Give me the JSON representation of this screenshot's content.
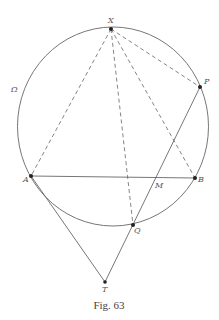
{
  "figure": {
    "caption": "Fig. 63",
    "circle_label": "Ω",
    "colors": {
      "stroke": "#666666",
      "point": "#222222",
      "text": "#555555"
    },
    "circle": {
      "cx": 113,
      "cy": 126.5,
      "rx": 95.5,
      "ry": 99.5
    },
    "points": {
      "X": {
        "label": "X",
        "x": 111,
        "y": 29
      },
      "P": {
        "label": "P",
        "x": 200,
        "y": 87
      },
      "A": {
        "label": "A",
        "x": 31,
        "y": 176
      },
      "B": {
        "label": "B",
        "x": 195,
        "y": 178
      },
      "M": {
        "label": "M",
        "x": 157,
        "y": 177
      },
      "Q": {
        "label": "Q",
        "x": 133,
        "y": 225
      },
      "T": {
        "label": "T",
        "x": 105,
        "y": 282
      }
    },
    "segments": [
      {
        "from": "X",
        "to": "A",
        "style": "dashed"
      },
      {
        "from": "X",
        "to": "Q",
        "style": "dashed"
      },
      {
        "from": "X",
        "to": "B",
        "style": "dashed"
      },
      {
        "from": "X",
        "to": "P",
        "style": "dashed"
      },
      {
        "from": "A",
        "to": "B",
        "style": "solid"
      },
      {
        "from": "A",
        "to": "T",
        "style": "solid"
      },
      {
        "from": "T",
        "to": "P",
        "style": "solid"
      }
    ]
  }
}
